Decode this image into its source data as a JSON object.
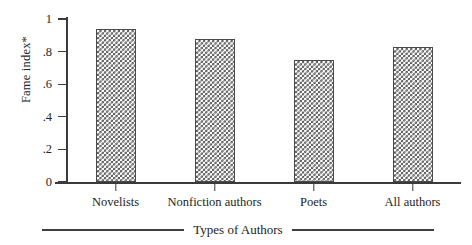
{
  "chart_data": {
    "type": "bar",
    "title": "",
    "xlabel": "Types of Authors",
    "ylabel": "Fame index*",
    "categories": [
      "Novelists",
      "Nonfiction authors",
      "Poets",
      "All authors"
    ],
    "values": [
      0.94,
      0.88,
      0.75,
      0.83
    ],
    "ylim": [
      0,
      1
    ],
    "yticks": [
      0,
      0.2,
      0.4,
      0.6,
      0.8,
      1
    ],
    "ytick_labels": [
      "0",
      ".2",
      ".4",
      ".6",
      ".8",
      "1"
    ],
    "grid": false,
    "legend": "none",
    "series": [
      {
        "name": "Fame index",
        "values": [
          0.94,
          0.88,
          0.75,
          0.83
        ]
      }
    ],
    "bar_fill": "checkerboard-hatch",
    "colors": {
      "bar_pattern": "#555555",
      "bar_background": "#ffffff",
      "bar_border": "#4a4a4a",
      "axis": "#3b3b3b",
      "text": "#1d1d1d",
      "page_background": "#ffffff"
    }
  }
}
